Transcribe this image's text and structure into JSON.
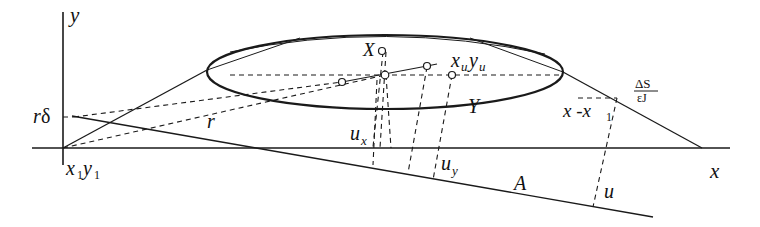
{
  "diagram": {
    "axes": {
      "y_label": "y",
      "x_label": "x",
      "origin_label_main1": "x",
      "origin_sub1": "1",
      "origin_label_main2": "y",
      "origin_sub2": "1"
    },
    "labels": {
      "r_delta_r": "r",
      "r_delta_delta": "δ",
      "r": "r",
      "X_main": "X",
      "X_sub": "n",
      "xuyu_x": "x",
      "xuyu_xsub": "u",
      "xuyu_y": "y",
      "xuyu_ysub": "u",
      "Y": "Y",
      "ux_main": "u",
      "ux_sub": "x",
      "uy_main": "u",
      "uy_sub": "y",
      "A": "A",
      "u": "u",
      "x_minus_x1_a": "x -x",
      "x_minus_x1_sub": "1",
      "frac_num": "ΔS",
      "frac_den": "εJ"
    },
    "colors": {
      "stroke": "#1a1a1a",
      "background": "#ffffff"
    }
  }
}
